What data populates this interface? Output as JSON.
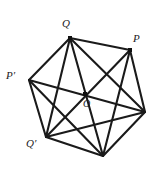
{
  "figure": {
    "type": "geometry-diagram",
    "stroke_color": "#1a1a1a",
    "background_color": "#ffffff",
    "vertex_dot_color": "#111111",
    "labels": {
      "q": "Q",
      "p": "P",
      "p_prime": "P′",
      "q_prime": "Q′",
      "o": "O"
    },
    "points": [
      {
        "id": "Q",
        "label": "Q",
        "x": 70,
        "y": 38,
        "label_x": 62,
        "label_y": 18,
        "dot": true
      },
      {
        "id": "P",
        "label": "P",
        "x": 130,
        "y": 50,
        "label_x": 133,
        "label_y": 33,
        "dot": true
      },
      {
        "id": "R",
        "label": "",
        "x": 145,
        "y": 112,
        "label_x": 0,
        "label_y": 0,
        "dot": false
      },
      {
        "id": "B",
        "label": "",
        "x": 103,
        "y": 156,
        "label_x": 0,
        "label_y": 0,
        "dot": false
      },
      {
        "id": "Qp",
        "label": "Q′",
        "x": 46,
        "y": 137,
        "label_x": 26,
        "label_y": 138,
        "dot": false
      },
      {
        "id": "Pp",
        "label": "P′",
        "x": 29,
        "y": 80,
        "label_x": 6,
        "label_y": 70,
        "dot": false
      },
      {
        "id": "O",
        "label": "O",
        "x": 85,
        "y": 94,
        "label_x": 83,
        "label_y": 99,
        "dot": true
      }
    ],
    "edges": [
      {
        "from": "Q",
        "to": "P",
        "kind": "hull"
      },
      {
        "from": "P",
        "to": "R",
        "kind": "hull"
      },
      {
        "from": "R",
        "to": "B",
        "kind": "hull"
      },
      {
        "from": "B",
        "to": "Qp",
        "kind": "hull"
      },
      {
        "from": "Qp",
        "to": "Pp",
        "kind": "hull"
      },
      {
        "from": "Pp",
        "to": "Q",
        "kind": "hull"
      },
      {
        "from": "Q",
        "to": "B",
        "kind": "main-diagonal"
      },
      {
        "from": "P",
        "to": "Qp",
        "kind": "main-diagonal"
      },
      {
        "from": "Pp",
        "to": "R",
        "kind": "main-diagonal"
      },
      {
        "from": "Q",
        "to": "Qp",
        "kind": "chord"
      },
      {
        "from": "Q",
        "to": "R",
        "kind": "chord"
      },
      {
        "from": "P",
        "to": "B",
        "kind": "chord"
      },
      {
        "from": "Pp",
        "to": "B",
        "kind": "chord"
      },
      {
        "from": "Qp",
        "to": "R",
        "kind": "chord"
      }
    ]
  }
}
